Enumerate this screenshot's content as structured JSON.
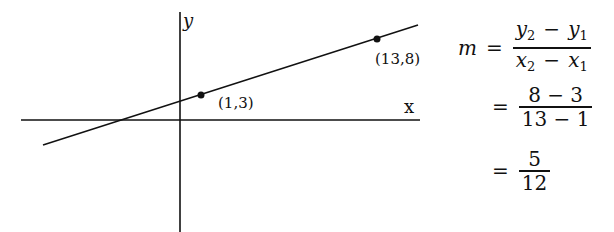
{
  "graph": {
    "axis_labels": {
      "y": "y",
      "x": "x"
    },
    "points": [
      {
        "label": "(1,3)",
        "x": 1,
        "y": 3
      },
      {
        "label": "(13,8)",
        "x": 13,
        "y": 8
      }
    ],
    "colors": {
      "stroke": "#111111",
      "background": "#ffffff"
    }
  },
  "equation": {
    "lhs": "m",
    "equals": "=",
    "step1": {
      "num": {
        "a": "y",
        "a_sub": "2",
        "op": "−",
        "b": "y",
        "b_sub": "1"
      },
      "den": {
        "a": "x",
        "a_sub": "2",
        "op": "−",
        "b": "x",
        "b_sub": "1"
      }
    },
    "step2": {
      "num": "8 − 3",
      "den": "13 − 1"
    },
    "step3": {
      "num": "5",
      "den": "12"
    }
  }
}
